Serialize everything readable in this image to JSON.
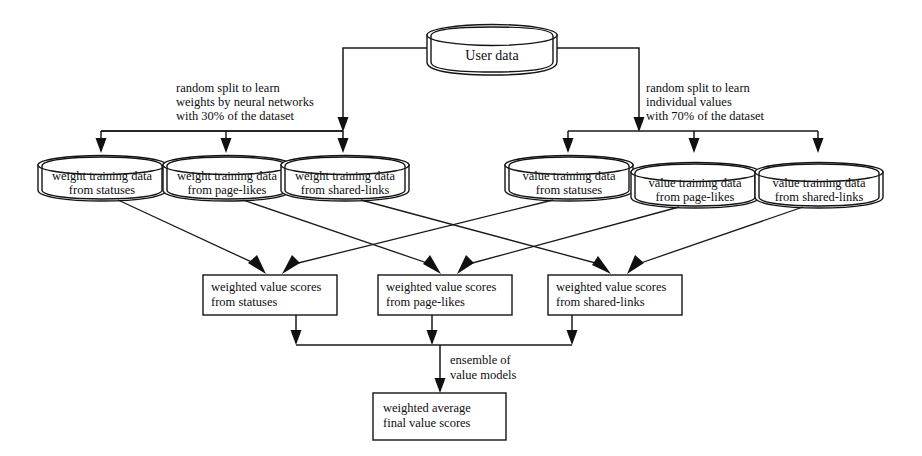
{
  "diagram": {
    "colors": {
      "stroke": "#141414",
      "background": "#ffffff",
      "text": "#0d0d0d"
    },
    "source": {
      "label": "User data"
    },
    "annotations": [
      {
        "id": "left-split",
        "lines": [
          "random split to learn",
          "weights by neural networks",
          "with 30% of the dataset"
        ]
      },
      {
        "id": "right-split",
        "lines": [
          "random split to learn",
          "individual values",
          "with 70% of the dataset"
        ]
      },
      {
        "id": "ensemble",
        "lines": [
          "ensemble of",
          "value models"
        ]
      }
    ],
    "weight_training": [
      {
        "id": "weight-statuses",
        "line1": "weight training data",
        "line2": "from statuses"
      },
      {
        "id": "weight-page-likes",
        "line1": "weight training data",
        "line2": "from page-likes"
      },
      {
        "id": "weight-shared-links",
        "line1": "weight training data",
        "line2": "from shared-links"
      }
    ],
    "value_training": [
      {
        "id": "value-statuses",
        "line1": "value training data",
        "line2": "from statuses"
      },
      {
        "id": "value-page-likes",
        "line1": "value training data",
        "line2": "from page-likes"
      },
      {
        "id": "value-shared-links",
        "line1": "value training data",
        "line2": "from shared-links"
      }
    ],
    "score_boxes": [
      {
        "id": "scores-statuses",
        "line1": "weighted value scores",
        "line2": "from statuses"
      },
      {
        "id": "scores-page-likes",
        "line1": "weighted value scores",
        "line2": "from page-likes"
      },
      {
        "id": "scores-shared-links",
        "line1": "weighted value scores",
        "line2": "from shared-links"
      }
    ],
    "final": {
      "line1": "weighted average",
      "line2": "final value scores"
    }
  }
}
